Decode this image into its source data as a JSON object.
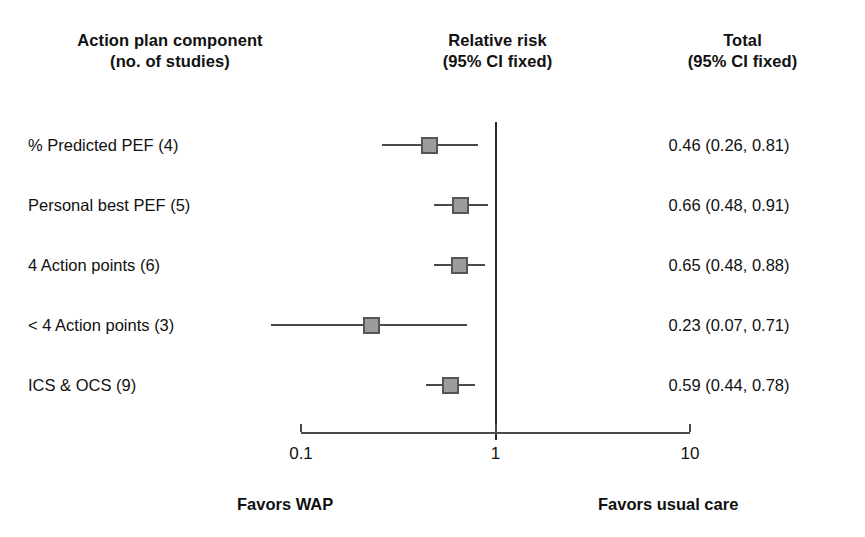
{
  "headers": {
    "component": {
      "line1": "Action plan component",
      "line2": "(no. of studies)"
    },
    "relative_risk": {
      "line1": "Relative risk",
      "line2": "(95% CI fixed)"
    },
    "total": {
      "line1": "Total",
      "line2": "(95% CI fixed)"
    }
  },
  "footer": {
    "left": "Favors WAP",
    "right": "Favors usual care"
  },
  "axis": {
    "scale": "log",
    "ticks": [
      "0.1",
      "1",
      "10"
    ],
    "tick_values": [
      0.1,
      1,
      10
    ],
    "null_value": 1
  },
  "colors": {
    "marker_fill": "#9c9c9c",
    "marker_border": "#555555",
    "line": "#4a4a4a",
    "text": "#111111",
    "background": "#ffffff"
  },
  "chart_data": {
    "type": "forest",
    "title": "",
    "xlabel": "",
    "ylabel": "",
    "xscale": "log",
    "xlim": [
      0.1,
      10
    ],
    "ticks": [
      0.1,
      1,
      10
    ],
    "tick_labels": [
      "0.1",
      "1",
      "10"
    ],
    "null_line": 1,
    "grid": false,
    "legend": "none",
    "effect_measure": "Relative risk (95% CI fixed)",
    "columns": [
      "Action plan component (no. of studies)",
      "Relative risk (95% CI fixed)",
      "Total (95% CI fixed)"
    ],
    "annotations": [
      "Favors WAP",
      "Favors usual care"
    ],
    "rows": [
      {
        "label": "% Predicted PEF (4)",
        "studies": 4,
        "estimate": 0.46,
        "ci_low": 0.26,
        "ci_high": 0.81,
        "value_text": "0.46 (0.26, 0.81)",
        "marker_size": 17
      },
      {
        "label": "Personal best PEF (5)",
        "studies": 5,
        "estimate": 0.66,
        "ci_low": 0.48,
        "ci_high": 0.91,
        "value_text": "0.66 (0.48, 0.91)",
        "marker_size": 17
      },
      {
        "label": "4 Action points (6)",
        "studies": 6,
        "estimate": 0.65,
        "ci_low": 0.48,
        "ci_high": 0.88,
        "value_text": "0.65 (0.48, 0.88)",
        "marker_size": 17
      },
      {
        "label": "< 4 Action points (3)",
        "studies": 3,
        "estimate": 0.23,
        "ci_low": 0.07,
        "ci_high": 0.71,
        "value_text": "0.23 (0.07, 0.71)",
        "marker_size": 17
      },
      {
        "label": "ICS & OCS (9)",
        "studies": 9,
        "estimate": 0.59,
        "ci_low": 0.44,
        "ci_high": 0.78,
        "value_text": "0.59 (0.44, 0.78)",
        "marker_size": 17
      }
    ]
  }
}
